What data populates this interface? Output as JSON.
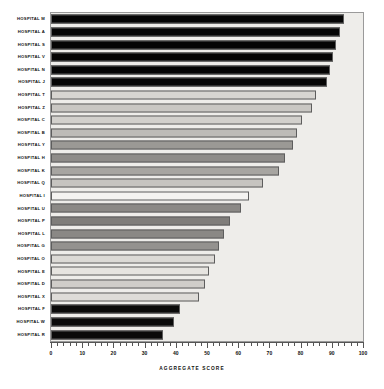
{
  "chart_data": {
    "type": "bar",
    "orientation": "horizontal",
    "title": "",
    "xlabel": "AGGREGATE SCORE",
    "ylabel": "",
    "xlim": [
      0,
      100
    ],
    "xticks": [
      0,
      10,
      20,
      30,
      40,
      50,
      60,
      70,
      80,
      90,
      100
    ],
    "xticklabels": [
      "0",
      "10",
      "20",
      "30",
      "40",
      "50",
      "60",
      "70",
      "80",
      "90",
      "100"
    ],
    "minor_tick_interval": 2,
    "grid": false,
    "legend": false,
    "categories": [
      "HOSPITAL M",
      "HOSPITAL A",
      "HOSPITAL S",
      "HOSPITAL V",
      "HOSPITAL N",
      "HOSPITAL J",
      "HOSPITAL T",
      "HOSPITAL Z",
      "HOSPITAL C",
      "HOSPITAL B",
      "HOSPITAL Y",
      "HOSPITAL H",
      "HOSPITAL K",
      "HOSPITAL Q",
      "HOSPITAL I",
      "HOSPITAL U",
      "HOSPITAL P",
      "HOSPITAL L",
      "HOSPITAL G",
      "HOSPITAL O",
      "HOSPITAL E",
      "HOSPITAL D",
      "HOSPITAL X",
      "HOSPITAL F",
      "HOSPITAL W",
      "HOSPITAL R"
    ],
    "values": [
      94.0,
      92.5,
      91.5,
      90.5,
      89.5,
      88.5,
      85.0,
      83.5,
      80.5,
      79.0,
      77.5,
      75.0,
      73.0,
      68.0,
      63.5,
      61.0,
      57.5,
      55.5,
      54.0,
      52.5,
      50.5,
      49.5,
      47.5,
      41.5,
      39.5,
      36.0
    ],
    "bar_colors": [
      "#050505",
      "#050505",
      "#050505",
      "#050505",
      "#050505",
      "#050505",
      "#d7d5d1",
      "#c9c7c3",
      "#d2d0cc",
      "#bdbbb7",
      "#9b9995",
      "#8e8c89",
      "#a7a5a1",
      "#c6c4c0",
      "#f4f3f1",
      "#8b8986",
      "#7f7d7a",
      "#8a8885",
      "#94928f",
      "#dcdad6",
      "#e6e4e0",
      "#cfcdc9",
      "#dedcd8",
      "#0a0a0a",
      "#0a0a0a",
      "#0a0a0a"
    ],
    "plot_background": "#eeedea",
    "page_background": "#ffffff"
  }
}
